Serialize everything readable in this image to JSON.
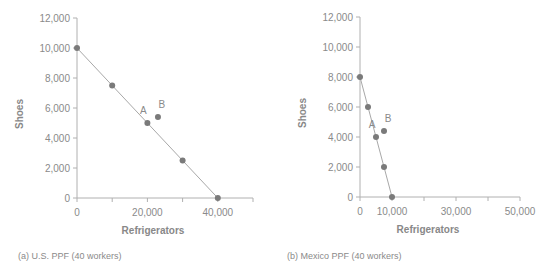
{
  "chart_data": [
    {
      "type": "scatter",
      "id": "us",
      "caption": "(a) U.S. PPF (40 workers)",
      "title": "",
      "xlabel": "Refrigerators",
      "ylabel": "Shoes",
      "xlim": [
        0,
        50000
      ],
      "ylim": [
        0,
        12000
      ],
      "x_ticks": [
        0,
        10000,
        20000,
        30000,
        40000,
        50000
      ],
      "x_tick_labels": [
        "0",
        "",
        "20,000",
        "",
        "40,000",
        ""
      ],
      "y_ticks": [
        0,
        2000,
        4000,
        6000,
        8000,
        10000,
        12000
      ],
      "y_tick_labels": [
        "0",
        "2,000",
        "4,000",
        "6,000",
        "8,000",
        "10,000",
        "12,000"
      ],
      "grid": false,
      "series": [
        {
          "name": "PPF",
          "line": true,
          "x": [
            0,
            10000,
            20000,
            30000,
            40000
          ],
          "y": [
            10000,
            7500,
            5000,
            2500,
            0
          ]
        },
        {
          "name": "B",
          "line": false,
          "x": [
            23000
          ],
          "y": [
            5400
          ]
        }
      ],
      "annotations": [
        {
          "text": "A",
          "x": 20000,
          "y": 5000
        },
        {
          "text": "B",
          "x": 23000,
          "y": 5400
        }
      ]
    },
    {
      "type": "scatter",
      "id": "mexico",
      "caption": "(b) Mexico PPF (40 workers)",
      "title": "",
      "xlabel": "Refrigerators",
      "ylabel": "Shoes",
      "xlim": [
        0,
        50000
      ],
      "ylim": [
        0,
        12000
      ],
      "x_ticks": [
        0,
        10000,
        20000,
        30000,
        40000,
        50000
      ],
      "x_tick_labels": [
        "0",
        "10,000",
        "",
        "30,000",
        "",
        "50,000"
      ],
      "y_ticks": [
        0,
        2000,
        4000,
        6000,
        8000,
        10000,
        12000
      ],
      "y_tick_labels": [
        "0",
        "2,000",
        "4,000",
        "6,000",
        "8,000",
        "10,000",
        "12,000"
      ],
      "grid": false,
      "series": [
        {
          "name": "PPF",
          "line": true,
          "x": [
            0,
            2500,
            5000,
            7500,
            10000
          ],
          "y": [
            8000,
            6000,
            4000,
            2000,
            0
          ]
        },
        {
          "name": "B",
          "line": false,
          "x": [
            7500
          ],
          "y": [
            4400
          ]
        }
      ],
      "annotations": [
        {
          "text": "A",
          "x": 5000,
          "y": 4000
        },
        {
          "text": "B",
          "x": 7500,
          "y": 4400
        }
      ]
    }
  ],
  "colors": {
    "axis": "#b0b0b0",
    "line": "#a8a8a8",
    "point": "#7a7a7a",
    "text": "#8a8a8a",
    "label": "#888888"
  }
}
